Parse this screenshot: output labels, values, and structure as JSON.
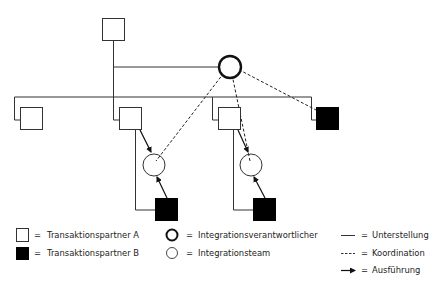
{
  "colors": {
    "stroke": "#333333",
    "fill_b": "#000000",
    "fill_a": "#ffffff",
    "text": "#222222"
  },
  "diagram": {
    "nodes": [
      {
        "id": "top-partner-a",
        "type": "transaktionspartner-a"
      },
      {
        "id": "integration-lead",
        "type": "integrationsverantwortlicher"
      },
      {
        "id": "partner-a-1",
        "type": "transaktionspartner-a"
      },
      {
        "id": "partner-a-2",
        "type": "transaktionspartner-a"
      },
      {
        "id": "partner-a-3",
        "type": "transaktionspartner-a"
      },
      {
        "id": "partner-b-right",
        "type": "transaktionspartner-b"
      },
      {
        "id": "team-left",
        "type": "integrationsteam"
      },
      {
        "id": "team-right",
        "type": "integrationsteam"
      },
      {
        "id": "partner-b-left",
        "type": "transaktionspartner-b"
      },
      {
        "id": "partner-b-middle",
        "type": "transaktionspartner-b"
      }
    ]
  },
  "legend": {
    "equals": "=",
    "items": [
      {
        "symbol": "white-square",
        "label": "Transaktionspartner A"
      },
      {
        "symbol": "black-square",
        "label": "Transaktionspartner B"
      },
      {
        "symbol": "thick-circle",
        "label": "Integrationsverantwortlicher"
      },
      {
        "symbol": "thin-circle",
        "label": "Integrationsteam"
      },
      {
        "symbol": "solid-line",
        "label": "Unterstellung"
      },
      {
        "symbol": "dashed-line",
        "label": "Koordination"
      },
      {
        "symbol": "arrow",
        "label": "Ausführung"
      }
    ]
  }
}
